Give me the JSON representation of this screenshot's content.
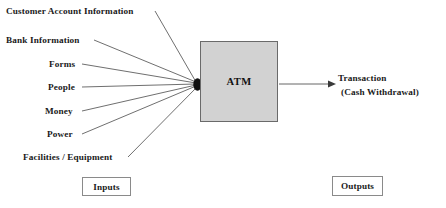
{
  "diagram": {
    "type": "ipo-diagram",
    "process": {
      "label": "ATM",
      "fill_color": "#d2d2d2",
      "border_color": "#6a6a6a"
    },
    "inputs": [
      {
        "label": "Customer Account Information"
      },
      {
        "label": "Bank Information"
      },
      {
        "label": "Forms"
      },
      {
        "label": "People"
      },
      {
        "label": "Money"
      },
      {
        "label": "Power"
      },
      {
        "label": "Facilities / Equipment"
      }
    ],
    "outputs": [
      {
        "line1": "Transaction",
        "line2": "(Cash Withdrawal)"
      }
    ],
    "legends": {
      "inputs": "Inputs",
      "outputs": "Outputs"
    },
    "line_color": "#555555",
    "junction_color": "#111111"
  }
}
